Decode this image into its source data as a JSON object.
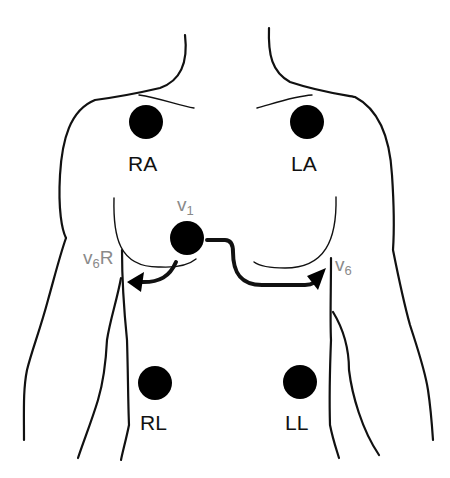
{
  "diagram": {
    "colors": {
      "outline": "#111111",
      "electrode": "#000000",
      "precordial_label": "#8a8a8a",
      "limb_label": "#111111"
    },
    "limb_electrodes": [
      {
        "id": "RA",
        "label": "RA"
      },
      {
        "id": "LA",
        "label": "LA"
      },
      {
        "id": "RL",
        "label": "RL"
      },
      {
        "id": "LL",
        "label": "LL"
      }
    ],
    "precordial": {
      "v1": {
        "main": "V",
        "sub": "1"
      },
      "v6r": {
        "main": "V",
        "sub": "6",
        "suffix": "R"
      },
      "v6": {
        "main": "V",
        "sub": "6"
      }
    },
    "arrows": [
      {
        "from": "V1",
        "to": "V6R"
      },
      {
        "from": "V1",
        "to": "V6"
      }
    ]
  }
}
